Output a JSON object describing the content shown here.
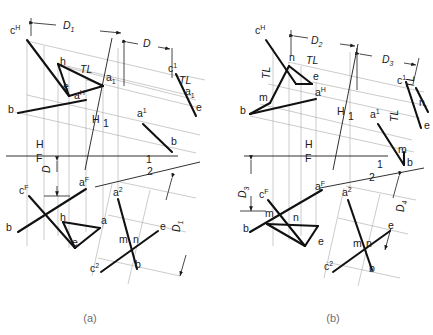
{
  "figure": {
    "type": "descriptive-geometry-orthographic-projection",
    "background_color": "#ffffff",
    "ink_color": "#1a1a1a",
    "construction_color": "#9a9a9a",
    "caption_color": "#6e6e6e",
    "panels": [
      {
        "id": "a",
        "caption": "(a)"
      },
      {
        "id": "b",
        "caption": "(b)"
      }
    ]
  },
  "panel_a": {
    "caption": "(a)",
    "dimensions": [
      {
        "name": "D1",
        "label": "D",
        "sub": "1"
      },
      {
        "name": "D",
        "label": "D",
        "sub": ""
      },
      {
        "name": "D_vert_left",
        "label": "D",
        "sub": ""
      },
      {
        "name": "D_rot_right",
        "label": "D",
        "sub": "1"
      }
    ],
    "fold_lines": [
      {
        "name": "H-F",
        "upper": "H",
        "lower": "F"
      },
      {
        "name": "H-1",
        "upper": "H",
        "lower": "1"
      },
      {
        "name": "1-2",
        "upper": "1",
        "lower": "2"
      }
    ],
    "true_length_marks": [
      "TL",
      "TL"
    ],
    "points": {
      "top_view": [
        "c",
        "h",
        "e",
        "a",
        "b"
      ],
      "front_view": [
        "c",
        "h",
        "e",
        "a",
        "b"
      ],
      "aux1_view": [
        "c",
        "a",
        "e",
        "b"
      ],
      "aux2_view": [
        "a",
        "c",
        "m",
        "n",
        "e",
        "b"
      ]
    },
    "labels": [
      {
        "text": "c",
        "sup": "H",
        "x": 10,
        "y": 34
      },
      {
        "text": "D",
        "sub": "1",
        "x": 63,
        "y": 29,
        "style": "dim"
      },
      {
        "text": "D",
        "sub": "",
        "x": 143,
        "y": 47,
        "style": "dim"
      },
      {
        "text": "h",
        "sup": "",
        "x": 60,
        "y": 65
      },
      {
        "text": "TL",
        "sup": "",
        "x": 80,
        "y": 73,
        "style": "tl"
      },
      {
        "text": "a",
        "sub": "1",
        "x": 106,
        "y": 81
      },
      {
        "text": "e",
        "sup": "",
        "x": 63,
        "y": 90
      },
      {
        "text": "c",
        "sup": "1",
        "x": 168,
        "y": 72
      },
      {
        "text": "TL",
        "sup": "",
        "x": 179,
        "y": 84,
        "style": "tl"
      },
      {
        "text": "a",
        "sub": "1",
        "x": 185,
        "y": 95
      },
      {
        "text": "e",
        "sup": "",
        "x": 196,
        "y": 111
      },
      {
        "text": "a",
        "sup": "H",
        "x": 74,
        "y": 99
      },
      {
        "text": "b",
        "sup": "",
        "x": 8,
        "y": 113
      },
      {
        "text": "a",
        "sup": "1",
        "x": 137,
        "y": 117
      },
      {
        "text": "H",
        "sup": "",
        "x": 92,
        "y": 123,
        "style": "fold"
      },
      {
        "text": "1",
        "sup": "",
        "x": 103,
        "y": 127,
        "style": "fold"
      },
      {
        "text": "b",
        "sup": "",
        "x": 171,
        "y": 145
      },
      {
        "text": "H",
        "sup": "",
        "x": 36,
        "y": 148,
        "style": "fold"
      },
      {
        "text": "F",
        "sup": "",
        "x": 36,
        "y": 162,
        "style": "fold"
      },
      {
        "text": "1",
        "sup": "",
        "x": 146,
        "y": 163,
        "style": "fold"
      },
      {
        "text": "2",
        "sup": "",
        "x": 147,
        "y": 175,
        "style": "fold"
      },
      {
        "text": "D",
        "sup": "",
        "x": 50,
        "y": 173,
        "style": "dim-rot"
      },
      {
        "text": "c",
        "sup": "F",
        "x": 19,
        "y": 194
      },
      {
        "text": "a",
        "sup": "F",
        "x": 79,
        "y": 186
      },
      {
        "text": "a",
        "sup": "2",
        "x": 113,
        "y": 196
      },
      {
        "text": "h",
        "sup": "",
        "x": 60,
        "y": 221
      },
      {
        "text": "a",
        "sup": "",
        "x": 101,
        "y": 224
      },
      {
        "text": "b",
        "sup": "",
        "x": 6,
        "y": 231
      },
      {
        "text": "e",
        "sup": "",
        "x": 72,
        "y": 246
      },
      {
        "text": "e",
        "sup": "",
        "x": 160,
        "y": 230
      },
      {
        "text": "D",
        "sub": "1",
        "x": 180,
        "y": 232,
        "style": "dim-rot"
      },
      {
        "text": "m",
        "sup": "",
        "x": 119,
        "y": 243
      },
      {
        "text": "n",
        "sup": "",
        "x": 133,
        "y": 243
      },
      {
        "text": "c",
        "sup": "2",
        "x": 90,
        "y": 272
      },
      {
        "text": "b",
        "sup": "",
        "x": 135,
        "y": 268
      }
    ]
  },
  "panel_b": {
    "caption": "(b)",
    "dimensions": [
      {
        "name": "D2",
        "label": "D",
        "sub": "2"
      },
      {
        "name": "D3",
        "label": "D",
        "sub": "3"
      },
      {
        "name": "D3_vert",
        "label": "D",
        "sub": "3"
      },
      {
        "name": "D4",
        "label": "D",
        "sub": "4"
      }
    ],
    "fold_lines": [
      {
        "name": "H-F",
        "upper": "H",
        "lower": "F"
      },
      {
        "name": "H-1",
        "upper": "H",
        "lower": "1"
      },
      {
        "name": "1-2",
        "upper": "1",
        "lower": "2"
      }
    ],
    "true_length_marks": [
      "TL",
      "TL",
      "TL"
    ],
    "labels": [
      {
        "text": "c",
        "sup": "H",
        "x": 255,
        "y": 34
      },
      {
        "text": "D",
        "sub": "2",
        "x": 311,
        "y": 44,
        "style": "dim"
      },
      {
        "text": "n",
        "sup": "",
        "x": 289,
        "y": 61
      },
      {
        "text": "TL",
        "sup": "",
        "x": 306,
        "y": 64,
        "style": "tl"
      },
      {
        "text": "e",
        "sup": "",
        "x": 313,
        "y": 80
      },
      {
        "text": "D",
        "sub": "3",
        "x": 382,
        "y": 63,
        "style": "dim"
      },
      {
        "text": "TL",
        "sup": "",
        "x": 270,
        "y": 79,
        "style": "tl-rot"
      },
      {
        "text": "c",
        "sup": "1",
        "x": 397,
        "y": 84
      },
      {
        "text": "TL",
        "sup": "",
        "x": 414,
        "y": 88,
        "style": "tl-rot"
      },
      {
        "text": "m",
        "sup": "",
        "x": 259,
        "y": 101
      },
      {
        "text": "a",
        "sup": "H",
        "x": 315,
        "y": 96
      },
      {
        "text": "b",
        "sup": "",
        "x": 240,
        "y": 114
      },
      {
        "text": "n",
        "sup": "",
        "x": 419,
        "y": 106
      },
      {
        "text": "H",
        "sup": "",
        "x": 337,
        "y": 115,
        "style": "fold"
      },
      {
        "text": "1",
        "sup": "",
        "x": 348,
        "y": 120,
        "style": "fold"
      },
      {
        "text": "a",
        "sup": "1",
        "x": 370,
        "y": 118
      },
      {
        "text": "TL",
        "sup": "",
        "x": 398,
        "y": 122,
        "style": "tl-rot"
      },
      {
        "text": "e",
        "sup": "",
        "x": 424,
        "y": 129
      },
      {
        "text": "m",
        "sup": "",
        "x": 398,
        "y": 153
      },
      {
        "text": "H",
        "sup": "",
        "x": 305,
        "y": 148,
        "style": "fold"
      },
      {
        "text": "F",
        "sup": "",
        "x": 305,
        "y": 162,
        "style": "fold"
      },
      {
        "text": "b",
        "sup": "",
        "x": 407,
        "y": 166
      },
      {
        "text": "1",
        "sup": "",
        "x": 377,
        "y": 168,
        "style": "fold"
      },
      {
        "text": "2",
        "sup": "",
        "x": 369,
        "y": 181,
        "style": "fold"
      },
      {
        "text": "D",
        "sub": "3",
        "x": 246,
        "y": 198,
        "style": "dim-rot"
      },
      {
        "text": "c",
        "sup": "F",
        "x": 259,
        "y": 198
      },
      {
        "text": "a",
        "sup": "F",
        "x": 315,
        "y": 190
      },
      {
        "text": "a",
        "sup": "2",
        "x": 342,
        "y": 196
      },
      {
        "text": "m",
        "sup": "",
        "x": 265,
        "y": 217
      },
      {
        "text": "n",
        "sup": "",
        "x": 293,
        "y": 221
      },
      {
        "text": "b",
        "sup": "",
        "x": 243,
        "y": 232
      },
      {
        "text": "e",
        "sup": "",
        "x": 318,
        "y": 245
      },
      {
        "text": "D",
        "sub": "4",
        "x": 404,
        "y": 212,
        "style": "dim-rot"
      },
      {
        "text": "e",
        "sup": "",
        "x": 388,
        "y": 229
      },
      {
        "text": "m",
        "sup": "",
        "x": 353,
        "y": 247
      },
      {
        "text": "n",
        "sup": "",
        "x": 366,
        "y": 247
      },
      {
        "text": "c",
        "sup": "2",
        "x": 324,
        "y": 270
      },
      {
        "text": "b",
        "sup": "",
        "x": 369,
        "y": 272
      }
    ]
  }
}
